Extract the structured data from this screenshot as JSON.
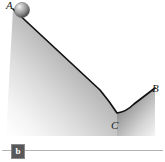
{
  "figure": {
    "type": "physics-diagram",
    "labels": {
      "A": "A",
      "B": "B",
      "C": "C"
    },
    "ball": {
      "name": "ball",
      "cx": 22,
      "cy": 10,
      "r": 7.5,
      "color_light": "#f0f0f0",
      "color_mid": "#9a9a9a",
      "color_dark": "#4e4e4e"
    },
    "surface": {
      "stroke_color": "#111111",
      "stroke_width": 1.6,
      "path_points": [
        {
          "label": "A",
          "x": 13,
          "y": 9
        },
        {
          "label": "slope-mid",
          "x": 62,
          "y": 54
        },
        {
          "label": "pre-C",
          "x": 100,
          "y": 90
        },
        {
          "label": "C",
          "x": 117,
          "y": 113
        },
        {
          "label": "post-C",
          "x": 134,
          "y": 104
        },
        {
          "label": "B",
          "x": 155,
          "y": 88
        }
      ]
    },
    "shading": {
      "fill_dark": "#6e6e6e",
      "fill_light": "#fbfbfb",
      "direction": "diagonal from upper-right dark to lower-left light"
    }
  },
  "caption": {
    "badge_label": "b",
    "badge_color": "#58585a",
    "rule_color": "#b3b3b3"
  }
}
